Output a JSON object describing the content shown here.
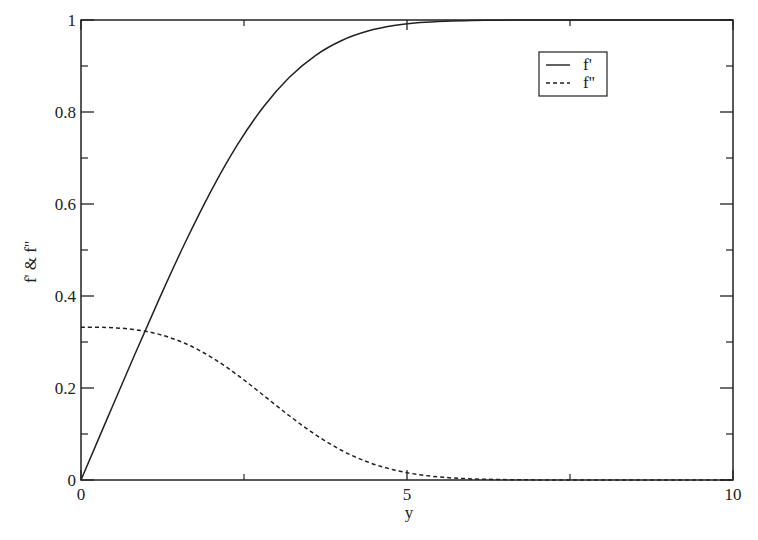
{
  "chart_data": {
    "type": "line",
    "title": "",
    "xlabel": "y",
    "ylabel": "f' & f''",
    "xlim": [
      0,
      10
    ],
    "ylim": [
      0,
      1
    ],
    "grid": false,
    "legend_position": "upper right (inside)",
    "x_ticks": [
      0,
      5,
      10
    ],
    "x_tick_labels": [
      "0",
      "5",
      "10"
    ],
    "x_minor_ticks": [
      2.5,
      7.5
    ],
    "y_ticks": [
      0,
      0.2,
      0.4,
      0.6,
      0.8,
      1
    ],
    "y_tick_labels": [
      "0",
      "0.2",
      "0.4",
      "0.6",
      "0.8",
      "1"
    ],
    "y_minor_ticks": [
      0.1,
      0.3,
      0.5,
      0.7,
      0.9
    ],
    "x": [
      0,
      0.4,
      0.8,
      1.2,
      1.6,
      2.0,
      2.4,
      2.8,
      3.2,
      3.6,
      4.0,
      4.4,
      4.8,
      5.2,
      5.6,
      6.0,
      6.4,
      6.8,
      7.2,
      7.6,
      8.0,
      8.4,
      8.8,
      9.2,
      9.6,
      10.0
    ],
    "series": [
      {
        "name": "f'",
        "style": "solid",
        "values": [
          0,
          0.1328,
          0.2647,
          0.3938,
          0.5168,
          0.6298,
          0.729,
          0.8115,
          0.8761,
          0.9233,
          0.9555,
          0.9759,
          0.9878,
          0.9943,
          0.9975,
          0.999,
          0.9996,
          0.9999,
          1.0,
          1.0,
          1.0,
          1.0,
          1.0,
          1.0,
          1.0,
          1.0
        ]
      },
      {
        "name": "f''",
        "style": "dashed",
        "values": [
          0.3321,
          0.3315,
          0.3274,
          0.3166,
          0.2967,
          0.2668,
          0.2281,
          0.184,
          0.1391,
          0.0981,
          0.0642,
          0.039,
          0.0219,
          0.0113,
          0.0054,
          0.0024,
          0.001,
          0.0004,
          0.0001,
          0.0,
          0.0,
          0.0,
          0.0,
          0.0,
          0.0,
          0.0
        ]
      }
    ]
  },
  "legend": {
    "items": [
      {
        "label": "f'",
        "style": "solid"
      },
      {
        "label": "f''",
        "style": "dashed"
      }
    ]
  },
  "colors": {
    "line": "#222222",
    "frame": "#222222",
    "background": "#ffffff"
  }
}
